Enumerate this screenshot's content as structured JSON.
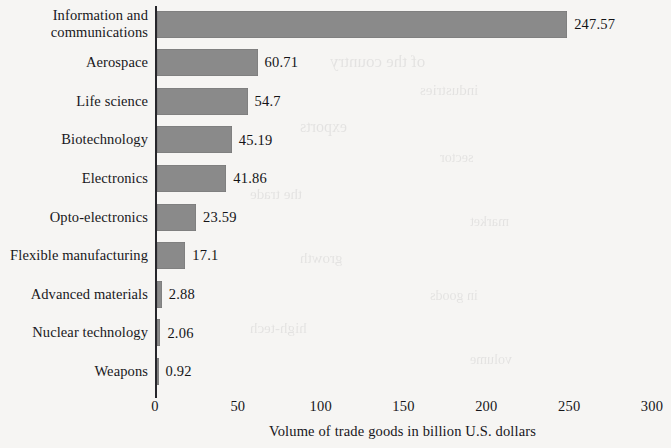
{
  "chart_data": {
    "type": "bar",
    "orientation": "horizontal",
    "title": "",
    "subtitle": "",
    "xlabel": "Volume of trade goods in billion U.S. dollars",
    "ylabel": "",
    "xlim": [
      0,
      300
    ],
    "xticks": [
      "0",
      "50",
      "100",
      "150",
      "200",
      "250",
      "300"
    ],
    "grid": false,
    "legend": null,
    "bar_color": "#8a8a8a",
    "background_color": "#f6f5f3",
    "text_color": "#17171a",
    "categories": [
      "Information and communications",
      "Aerospace",
      "Life science",
      "Biotechnology",
      "Electronics",
      "Opto-electronics",
      "Flexible manufacturing",
      "Advanced materials",
      "Nuclear technology",
      "Weapons"
    ],
    "values": [
      247.57,
      60.71,
      54.7,
      45.19,
      41.86,
      23.59,
      17.1,
      2.88,
      2.06,
      0.92
    ],
    "data_labels": [
      "247.57",
      "60.71",
      "54.7",
      "45.19",
      "41.86",
      "23.59",
      "17.1",
      "2.88",
      "2.06",
      "0.92"
    ]
  },
  "rows": [
    {
      "label_line1": "Information and",
      "label_line2": "communications",
      "value": 247.57,
      "value_label": "247.57"
    },
    {
      "label_line1": "Aerospace",
      "label_line2": "",
      "value": 60.71,
      "value_label": "60.71"
    },
    {
      "label_line1": "Life science",
      "label_line2": "",
      "value": 54.7,
      "value_label": "54.7"
    },
    {
      "label_line1": "Biotechnology",
      "label_line2": "",
      "value": 45.19,
      "value_label": "45.19"
    },
    {
      "label_line1": "Electronics",
      "label_line2": "",
      "value": 41.86,
      "value_label": "41.86"
    },
    {
      "label_line1": "Opto-electronics",
      "label_line2": "",
      "value": 23.59,
      "value_label": "23.59"
    },
    {
      "label_line1": "Flexible manufacturing",
      "label_line2": "",
      "value": 17.1,
      "value_label": "17.1"
    },
    {
      "label_line1": "Advanced materials",
      "label_line2": "",
      "value": 2.88,
      "value_label": "2.88"
    },
    {
      "label_line1": "Nuclear technology",
      "label_line2": "",
      "value": 2.06,
      "value_label": "2.06"
    },
    {
      "label_line1": "Weapons",
      "label_line2": "",
      "value": 0.92,
      "value_label": "0.92"
    }
  ],
  "axis": {
    "ticks": [
      {
        "label": "0",
        "value": 0
      },
      {
        "label": "50",
        "value": 50
      },
      {
        "label": "100",
        "value": 100
      },
      {
        "label": "150",
        "value": 150
      },
      {
        "label": "200",
        "value": 200
      },
      {
        "label": "250",
        "value": 250
      },
      {
        "label": "300",
        "value": 300
      }
    ],
    "title": "Volume of trade goods in billion U.S. dollars"
  }
}
